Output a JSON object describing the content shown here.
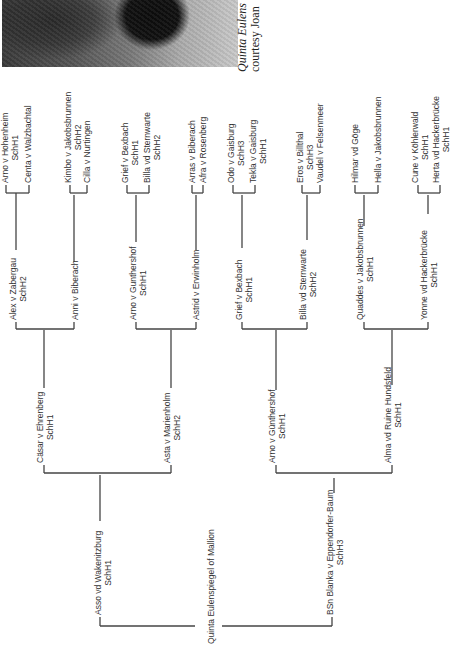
{
  "photo": {
    "description": "dog-photo-fragment"
  },
  "caption": {
    "line1": "Quinta Eulens",
    "line2": "courtesy Joan"
  },
  "pedigree": {
    "subject": "Quinta Eulenspiegel of Mallion",
    "sire": {
      "name": "Asso vd Wakenitzburg",
      "reg": "SchH1"
    },
    "dam": {
      "name": "BSn Blanka v Eppendorfer-Baum",
      "reg": "SchH3"
    },
    "gen2": [
      {
        "name": "Cäsar v Ehrenberg",
        "reg": "SchH1"
      },
      {
        "name": "Asta v Marienholm",
        "reg": "SchH2"
      },
      {
        "name": "Arno v Günthershof",
        "reg": "SchH1"
      },
      {
        "name": "Alma vd Ruine Hundsfeld",
        "reg": "SchH1"
      }
    ],
    "gen3": [
      {
        "name": "Alex v Zabergau",
        "reg": "SchH2"
      },
      {
        "name": "Anni v Biberach",
        "reg": ""
      },
      {
        "name": "Arno v Gunthershof",
        "reg": "SchH1"
      },
      {
        "name": "Astrid v Erwinholm",
        "reg": ""
      },
      {
        "name": "Grief v Bexbach",
        "reg": "SchH1"
      },
      {
        "name": "Billa vd Sternwarte",
        "reg": "SchH2"
      },
      {
        "name": "Quaddes v Jakobsbrunnen",
        "reg": "SchH1"
      },
      {
        "name": "Yonne vd Hackerbrücke",
        "reg": "SchH1"
      }
    ],
    "gen4": [
      {
        "name": "Arno v Hohenheim",
        "reg": "SchH1"
      },
      {
        "name": "Centa v Walzbachtal",
        "reg": ""
      },
      {
        "name": "Kimbo v Jakobsbrunnen",
        "reg": "SchH2"
      },
      {
        "name": "Cilla v Nurtingen",
        "reg": ""
      },
      {
        "name": "Grief v Bexbach",
        "reg": "SchH1"
      },
      {
        "name": "Billa vd Sternwarte",
        "reg": "SchH2"
      },
      {
        "name": "Arras v Biberach",
        "reg": ""
      },
      {
        "name": "Afra v Rosenberg",
        "reg": ""
      },
      {
        "name": "Odo v Gaisburg",
        "reg": "SchH3"
      },
      {
        "name": "Tekla v Gaisburg",
        "reg": "SchH1"
      },
      {
        "name": "Eros v Billthal",
        "reg": "SchH3"
      },
      {
        "name": "Vaudel v Felsenmeer",
        "reg": ""
      },
      {
        "name": "Hilmar vd Göge",
        "reg": ""
      },
      {
        "name": "Hella v Jakobsbrunnen",
        "reg": ""
      },
      {
        "name": "Cune v Köhlerwald",
        "reg": "SchH1"
      },
      {
        "name": "Herta vd Hackerbrücke",
        "reg": "SchH1"
      }
    ]
  }
}
